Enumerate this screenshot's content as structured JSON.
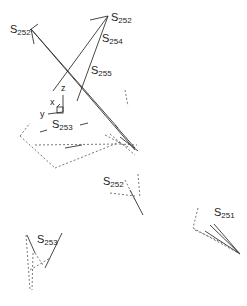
{
  "diagram": {
    "type": "3d-structure-diagram",
    "labels": [
      {
        "id": "s252-top-left",
        "base": "S",
        "sub": "252",
        "x": 10,
        "y": 24
      },
      {
        "id": "s252-top-right",
        "base": "S",
        "sub": "252",
        "x": 111,
        "y": 12
      },
      {
        "id": "s254",
        "base": "S",
        "sub": "254",
        "x": 102,
        "y": 33
      },
      {
        "id": "s255",
        "base": "S",
        "sub": "255",
        "x": 91,
        "y": 65
      },
      {
        "id": "s253-mid",
        "base": "S",
        "sub": "253",
        "x": 52,
        "y": 119
      },
      {
        "id": "s252-mid",
        "base": "S",
        "sub": "252",
        "x": 103,
        "y": 176
      },
      {
        "id": "s251",
        "base": "S",
        "sub": "251",
        "x": 214,
        "y": 207
      },
      {
        "id": "s253-bottom",
        "base": "S",
        "sub": "253",
        "x": 37,
        "y": 234
      }
    ],
    "axes": {
      "z": "z",
      "x": "x",
      "y": "y"
    },
    "line_color": "#333333",
    "dashed_color": "#555555"
  }
}
